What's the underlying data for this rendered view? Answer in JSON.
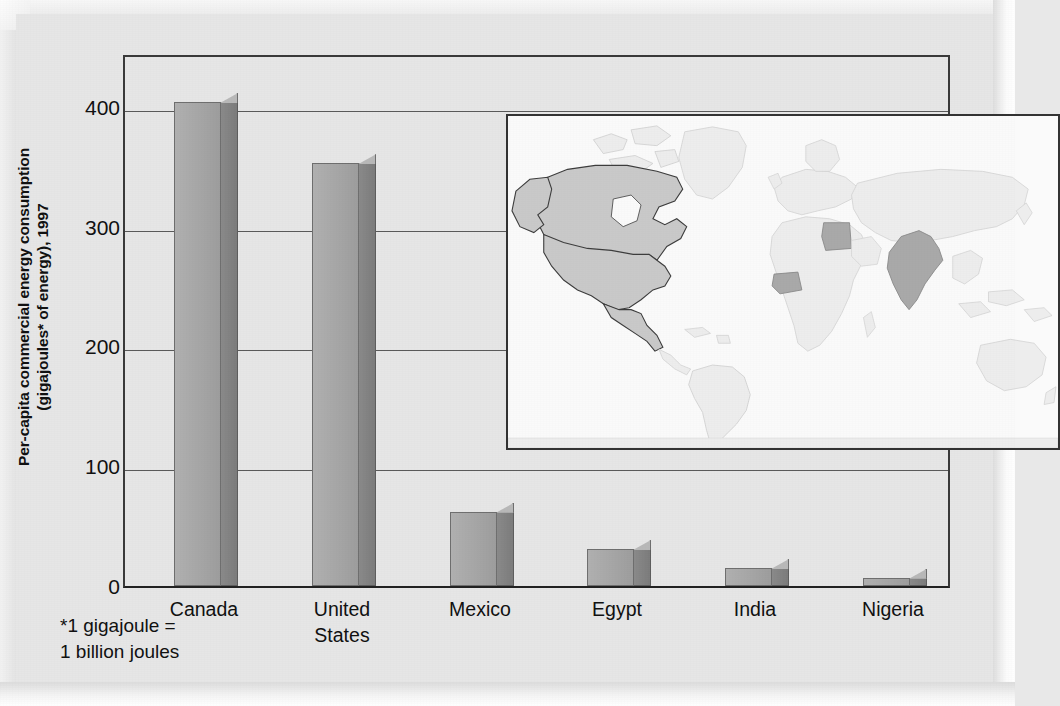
{
  "figure": {
    "y_axis_title_line1": "Per-capita commercial energy consumption",
    "y_axis_title_line2": "(gigajoules* of energy), 1997",
    "footnote_line1": "*1 gigajoule =",
    "footnote_line2": "1 billion joules",
    "map_caption": "world-map-inset",
    "colors": {
      "bar_front": "#a6a6a6",
      "bar_side": "#7c7c7c",
      "bar_outline": "#6f6f6f",
      "plot_background": "#e6e6e6",
      "gridline": "#5a5a5a",
      "axis": "#3a3a3a",
      "page_background": "#e3e3e3",
      "map_background": "#fafafa",
      "map_land": "#ededed",
      "map_highlight_light": "#c9c9c9",
      "map_highlight_dark": "#a9a9a9"
    }
  },
  "chart_data": {
    "type": "bar",
    "title": "",
    "xlabel": "",
    "ylabel": "Per-capita commercial energy consumption (gigajoules* of energy), 1997",
    "categories": [
      "Canada",
      "United States",
      "Mexico",
      "Egypt",
      "India",
      "Nigeria"
    ],
    "category_labels": [
      [
        "Canada"
      ],
      [
        "United",
        "States"
      ],
      [
        "Mexico"
      ],
      [
        "Egypt"
      ],
      [
        "India"
      ],
      [
        "Nigeria"
      ]
    ],
    "values": [
      404,
      353,
      62,
      31,
      15,
      7
    ],
    "ylim": [
      0,
      445
    ],
    "yticks": [
      0,
      100,
      200,
      300,
      400
    ],
    "ytick_labels": [
      "0",
      "100",
      "200",
      "300",
      "400"
    ],
    "grid": true,
    "legend": "none",
    "annotations": [
      "*1 gigajoule = 1 billion joules"
    ],
    "inset": {
      "type": "map",
      "description": "world map with Canada, United States, Mexico, Egypt, India and Nigeria shaded",
      "highlighted_countries": [
        "Canada",
        "United States",
        "Mexico",
        "Egypt",
        "India",
        "Nigeria"
      ]
    }
  }
}
